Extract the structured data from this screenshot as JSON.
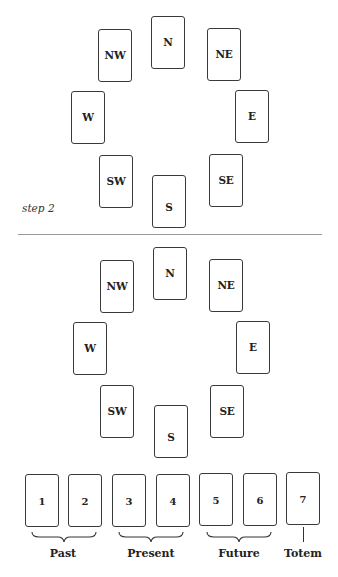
{
  "step_label": "step 2",
  "layout_top": {
    "cards": [
      {
        "label": "N",
        "x": 151,
        "y": 16
      },
      {
        "label": "NW",
        "x": 98,
        "y": 29
      },
      {
        "label": "NE",
        "x": 207,
        "y": 28
      },
      {
        "label": "W",
        "x": 71,
        "y": 91
      },
      {
        "label": "E",
        "x": 235,
        "y": 90
      },
      {
        "label": "SW",
        "x": 99,
        "y": 155
      },
      {
        "label": "S",
        "x": 152,
        "y": 175
      },
      {
        "label": "SE",
        "x": 209,
        "y": 154
      }
    ]
  },
  "layout_bottom": {
    "compass_cards": [
      {
        "label": "N",
        "x": 153,
        "y": 247
      },
      {
        "label": "NW",
        "x": 100,
        "y": 260
      },
      {
        "label": "NE",
        "x": 209,
        "y": 259
      },
      {
        "label": "W",
        "x": 73,
        "y": 322
      },
      {
        "label": "E",
        "x": 236,
        "y": 321
      },
      {
        "label": "SW",
        "x": 100,
        "y": 385
      },
      {
        "label": "S",
        "x": 154,
        "y": 405
      },
      {
        "label": "SE",
        "x": 210,
        "y": 385
      }
    ],
    "row_cards": [
      {
        "label": "1",
        "x": 25,
        "y": 474
      },
      {
        "label": "2",
        "x": 68,
        "y": 474
      },
      {
        "label": "3",
        "x": 112,
        "y": 474
      },
      {
        "label": "4",
        "x": 156,
        "y": 474
      },
      {
        "label": "5",
        "x": 199,
        "y": 473
      },
      {
        "label": "6",
        "x": 243,
        "y": 473
      },
      {
        "label": "7",
        "x": 286,
        "y": 472
      }
    ],
    "groups": [
      {
        "label": "Past",
        "cards": [
          "1",
          "2"
        ],
        "center_x": 63
      },
      {
        "label": "Present",
        "cards": [
          "3",
          "4"
        ],
        "center_x": 151
      },
      {
        "label": "Future",
        "cards": [
          "5",
          "6"
        ],
        "center_x": 239
      },
      {
        "label": "Totem",
        "cards": [
          "7"
        ],
        "center_x": 303
      }
    ]
  }
}
